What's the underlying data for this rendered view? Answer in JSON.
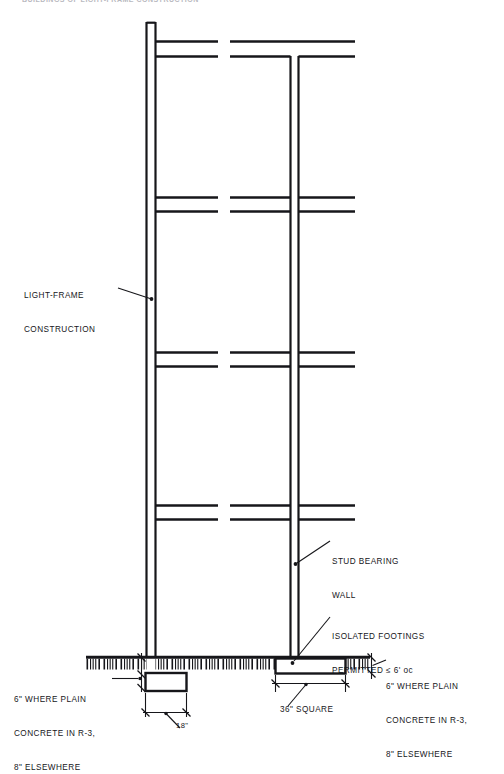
{
  "page": {
    "header_text": "BUILDINGS OF LIGHT-FRAME CONSTRUCTION",
    "background_color": "#ffffff",
    "ink_color": "#16161a",
    "width": 504,
    "height": 754
  },
  "drawing": {
    "title": "section-through-light-frame-bearing-wall-building",
    "annotations": [
      {
        "id": "light-frame-construction",
        "lines": [
          "LIGHT-FRAME",
          "CONSTRUCTION"
        ],
        "leader_from": [
          118,
          290
        ],
        "leader_to": [
          152,
          299
        ]
      },
      {
        "id": "stud-bearing-wall",
        "lines": [
          "STUD BEARING",
          "WALL"
        ],
        "leader_from": [
          330,
          540
        ],
        "leader_to": [
          295,
          563
        ]
      },
      {
        "id": "isolated-footings",
        "lines": [
          "ISOLATED FOOTINGS",
          "PERMITTED ≤ 6' oc"
        ],
        "leader_from": [
          330,
          616
        ],
        "leader_to": [
          292,
          661
        ]
      },
      {
        "id": "plain-concrete-right",
        "lines": [
          "6\" WHERE PLAIN",
          "CONCRETE IN R-3,",
          "8\" ELSEWHERE"
        ],
        "leader_from": [
          384,
          662
        ],
        "leader_to": [
          372,
          656
        ]
      },
      {
        "id": "plain-concrete-left",
        "lines": [
          "6\" WHERE PLAIN",
          "CONCRETE IN R-3,",
          "8\" ELSEWHERE"
        ],
        "leader_from": [
          112,
          678
        ],
        "leader_to": [
          140,
          678
        ]
      }
    ],
    "dimensions": [
      {
        "id": "footing-width-18",
        "label": "18\"",
        "extent_x": [
          145,
          186
        ],
        "y": 712,
        "leader_to": [
          166,
          716
        ]
      },
      {
        "id": "isolated-footing-width-36",
        "label": "36\" SQUARE",
        "extent_x": [
          275,
          345
        ],
        "y": 683,
        "leader_to": [
          305,
          698
        ]
      },
      {
        "id": "slab-thickness-right",
        "label": "",
        "extent_y": [
          657,
          673
        ],
        "x": 371
      },
      {
        "id": "slab-thickness-left",
        "label": "",
        "extent_y": [
          657,
          673
        ],
        "x": 142
      }
    ],
    "elements": {
      "exterior_wall_label": "exterior stud bearing wall",
      "interior_wall_label": "interior stud bearing wall",
      "floor_label": "floor / roof framing line",
      "slab_label": "concrete slab on grade (hatched)",
      "strip_footing_label": "continuous strip footing",
      "isolated_footing_label": "isolated spread footing"
    }
  }
}
